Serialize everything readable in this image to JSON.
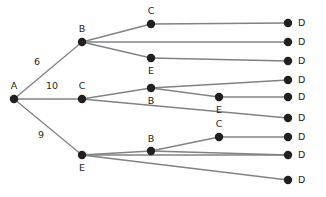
{
  "diagram": {
    "type": "tree",
    "canvas": {
      "width": 326,
      "height": 197
    },
    "colors": {
      "node_fill": "#231f20",
      "edge_stroke": "#808285",
      "label_text": "#231f20",
      "background": "#ffffff"
    },
    "node_radius": 4.2,
    "nodes": [
      {
        "id": "n0",
        "label": "A",
        "x": 14,
        "y": 99,
        "label_x": 14,
        "label_y": 86,
        "anchor": "middle"
      },
      {
        "id": "n1",
        "label": "B",
        "x": 82,
        "y": 42,
        "label_x": 82,
        "label_y": 29,
        "anchor": "middle"
      },
      {
        "id": "n2",
        "label": "C",
        "x": 151,
        "y": 24,
        "label_x": 151,
        "label_y": 11,
        "anchor": "middle"
      },
      {
        "id": "n3",
        "label": "E",
        "x": 151,
        "y": 58,
        "label_x": 151,
        "label_y": 71,
        "anchor": "middle"
      },
      {
        "id": "n4",
        "label": "C",
        "x": 82,
        "y": 99,
        "label_x": 82,
        "label_y": 86,
        "anchor": "middle"
      },
      {
        "id": "n5",
        "label": "B",
        "x": 151,
        "y": 88,
        "label_x": 151,
        "label_y": 101,
        "anchor": "middle"
      },
      {
        "id": "n6",
        "label": "E",
        "x": 219,
        "y": 97,
        "label_x": 219,
        "label_y": 110,
        "anchor": "middle"
      },
      {
        "id": "n7",
        "label": "E",
        "x": 82,
        "y": 155,
        "label_x": 82,
        "label_y": 168,
        "anchor": "middle"
      },
      {
        "id": "n8",
        "label": "B",
        "x": 151,
        "y": 151,
        "label_x": 151,
        "label_y": 139,
        "anchor": "middle"
      },
      {
        "id": "n9",
        "label": "C",
        "x": 219,
        "y": 137,
        "label_x": 219,
        "label_y": 124,
        "anchor": "middle"
      },
      {
        "id": "d1",
        "label": "D",
        "x": 288,
        "y": 23,
        "label_x": 298,
        "label_y": 23,
        "anchor": "start"
      },
      {
        "id": "d2",
        "label": "D",
        "x": 288,
        "y": 42,
        "label_x": 298,
        "label_y": 42,
        "anchor": "start"
      },
      {
        "id": "d3",
        "label": "D",
        "x": 288,
        "y": 61,
        "label_x": 298,
        "label_y": 61,
        "anchor": "start"
      },
      {
        "id": "d4",
        "label": "D",
        "x": 288,
        "y": 80,
        "label_x": 298,
        "label_y": 80,
        "anchor": "start"
      },
      {
        "id": "d5",
        "label": "D",
        "x": 288,
        "y": 97,
        "label_x": 298,
        "label_y": 97,
        "anchor": "start"
      },
      {
        "id": "d6",
        "label": "D",
        "x": 288,
        "y": 118,
        "label_x": 298,
        "label_y": 118,
        "anchor": "start"
      },
      {
        "id": "d7",
        "label": "D",
        "x": 288,
        "y": 137,
        "label_x": 298,
        "label_y": 137,
        "anchor": "start"
      },
      {
        "id": "d8",
        "label": "D",
        "x": 288,
        "y": 155,
        "label_x": 298,
        "label_y": 155,
        "anchor": "start"
      },
      {
        "id": "d9",
        "label": "D",
        "x": 288,
        "y": 180,
        "label_x": 298,
        "label_y": 180,
        "anchor": "start"
      }
    ],
    "edges": [
      {
        "from": "n0",
        "to": "n1",
        "x1": 14,
        "y1": 99,
        "x2": 82,
        "y2": 42,
        "weight": "6",
        "label_x": 37,
        "label_y": 62
      },
      {
        "from": "n0",
        "to": "n4",
        "x1": 14,
        "y1": 99,
        "x2": 82,
        "y2": 99,
        "weight": "10",
        "label_x": 52,
        "label_y": 86
      },
      {
        "from": "n0",
        "to": "n7",
        "x1": 14,
        "y1": 99,
        "x2": 82,
        "y2": 155,
        "weight": "9",
        "label_x": 41,
        "label_y": 135
      },
      {
        "from": "n1",
        "to": "n2",
        "x1": 82,
        "y1": 42,
        "x2": 151,
        "y2": 24,
        "weight": "",
        "label_x": 0,
        "label_y": 0
      },
      {
        "from": "n1",
        "to": "d2",
        "x1": 82,
        "y1": 42,
        "x2": 288,
        "y2": 42,
        "weight": "",
        "label_x": 0,
        "label_y": 0
      },
      {
        "from": "n1",
        "to": "n3",
        "x1": 82,
        "y1": 42,
        "x2": 151,
        "y2": 58,
        "weight": "",
        "label_x": 0,
        "label_y": 0
      },
      {
        "from": "n2",
        "to": "d1",
        "x1": 151,
        "y1": 24,
        "x2": 288,
        "y2": 23,
        "weight": "",
        "label_x": 0,
        "label_y": 0
      },
      {
        "from": "n3",
        "to": "d3",
        "x1": 151,
        "y1": 58,
        "x2": 288,
        "y2": 61,
        "weight": "",
        "label_x": 0,
        "label_y": 0
      },
      {
        "from": "n4",
        "to": "n5",
        "x1": 82,
        "y1": 99,
        "x2": 151,
        "y2": 88,
        "weight": "",
        "label_x": 0,
        "label_y": 0
      },
      {
        "from": "n4",
        "to": "d6",
        "x1": 82,
        "y1": 99,
        "x2": 288,
        "y2": 118,
        "weight": "",
        "label_x": 0,
        "label_y": 0
      },
      {
        "from": "n5",
        "to": "d4",
        "x1": 151,
        "y1": 88,
        "x2": 288,
        "y2": 80,
        "weight": "",
        "label_x": 0,
        "label_y": 0
      },
      {
        "from": "n5",
        "to": "n6",
        "x1": 151,
        "y1": 88,
        "x2": 219,
        "y2": 97,
        "weight": "",
        "label_x": 0,
        "label_y": 0
      },
      {
        "from": "n6",
        "to": "d5",
        "x1": 219,
        "y1": 97,
        "x2": 288,
        "y2": 97,
        "weight": "",
        "label_x": 0,
        "label_y": 0
      },
      {
        "from": "n7",
        "to": "n8",
        "x1": 82,
        "y1": 155,
        "x2": 151,
        "y2": 151,
        "weight": "",
        "label_x": 0,
        "label_y": 0
      },
      {
        "from": "n7",
        "to": "d8",
        "x1": 82,
        "y1": 155,
        "x2": 288,
        "y2": 155,
        "weight": "",
        "label_x": 0,
        "label_y": 0
      },
      {
        "from": "n7",
        "to": "d9",
        "x1": 82,
        "y1": 155,
        "x2": 288,
        "y2": 180,
        "weight": "",
        "label_x": 0,
        "label_y": 0
      },
      {
        "from": "n8",
        "to": "n9",
        "x1": 151,
        "y1": 151,
        "x2": 219,
        "y2": 137,
        "weight": "",
        "label_x": 0,
        "label_y": 0
      },
      {
        "from": "n8",
        "to": "d7",
        "x1": 151,
        "y1": 151,
        "x2": 288,
        "y2": 155,
        "weight": "",
        "label_x": 0,
        "label_y": 0
      },
      {
        "from": "n9",
        "to": "d7",
        "x1": 219,
        "y1": 137,
        "x2": 288,
        "y2": 137,
        "weight": "",
        "label_x": 0,
        "label_y": 0
      }
    ]
  }
}
